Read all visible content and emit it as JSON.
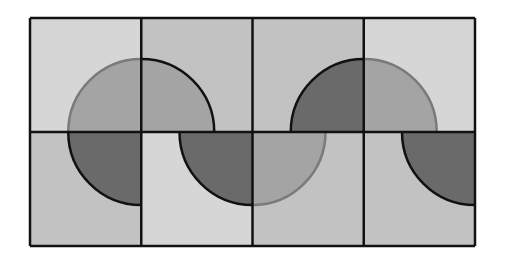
{
  "figure": {
    "title": "",
    "colors": {
      "light": "#d6d6d6",
      "mid_light": "#c2c2c2",
      "medium": "#a4a4a4",
      "dark": "#6a6a6a",
      "outline": "#111111",
      "arc_soft": "#7a7a7a"
    },
    "tiles": [
      {
        "row": 0,
        "col": 0,
        "bg": "light",
        "quarter": "bottom-right",
        "fill": "medium",
        "arc": "soft"
      },
      {
        "row": 0,
        "col": 1,
        "bg": "mid_light",
        "quarter": "bottom-left",
        "fill": "medium",
        "arc": "dark"
      },
      {
        "row": 0,
        "col": 2,
        "bg": "mid_light",
        "quarter": "bottom-right",
        "fill": "dark",
        "arc": "dark"
      },
      {
        "row": 0,
        "col": 3,
        "bg": "light",
        "quarter": "bottom-left",
        "fill": "medium",
        "arc": "soft"
      },
      {
        "row": 1,
        "col": 0,
        "bg": "mid_light",
        "quarter": "top-right",
        "fill": "dark",
        "arc": "dark"
      },
      {
        "row": 1,
        "col": 1,
        "bg": "light",
        "quarter": "top-right",
        "fill": "dark",
        "arc": "dark"
      },
      {
        "row": 1,
        "col": 2,
        "bg": "mid_light",
        "quarter": "top-left",
        "fill": "medium",
        "arc": "soft"
      },
      {
        "row": 1,
        "col": 3,
        "bg": "mid_light",
        "quarter": "top-right",
        "fill": "dark",
        "arc": "dark"
      }
    ]
  }
}
